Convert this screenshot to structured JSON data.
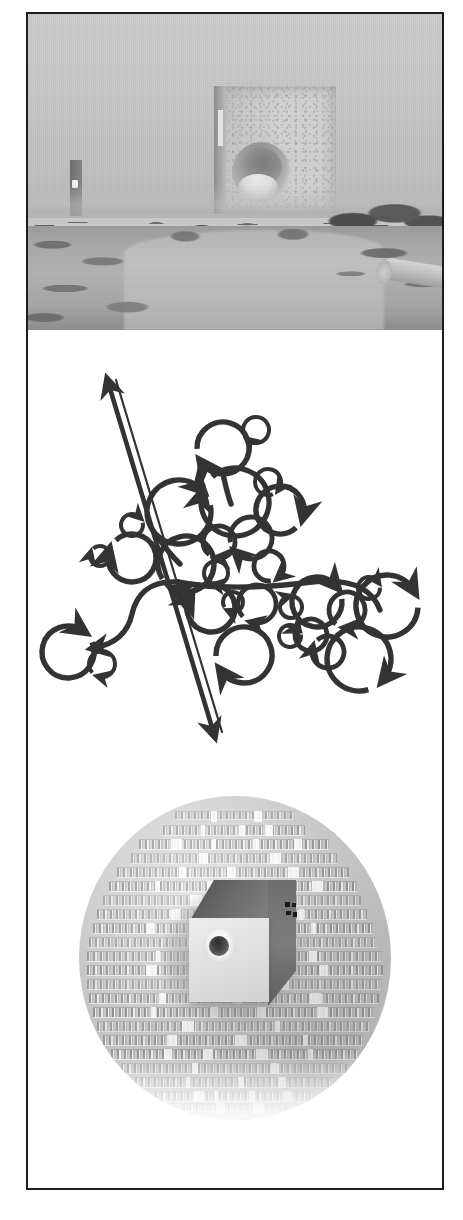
{
  "figure": {
    "panel_count": 3,
    "frame_color": "#1d1d1d",
    "background_color": "#ffffff"
  },
  "panels": [
    {
      "id": "photo",
      "type": "photograph",
      "palette": "grayscale",
      "description": "Overcast outdoor landscape with a dirt path, low scrub vegetation, a large cubic concrete monolith with a circular aperture on the horizon, a thin tall monolith at left, and a pale pipe lying at lower right.",
      "elements": [
        {
          "name": "sky",
          "label": "Overcast sky",
          "color": "#cbcbcb"
        },
        {
          "name": "monolith-large",
          "label": "Large cubic monolith with circular aperture",
          "color": "#c9c9c9"
        },
        {
          "name": "monolith-small",
          "label": "Tall narrow monolith",
          "color": "#7e7e7e"
        },
        {
          "name": "treeline",
          "label": "Distant scrub treeline",
          "color": "#5f5f5f"
        },
        {
          "name": "path",
          "label": "Dirt path",
          "color": "#bababa"
        },
        {
          "name": "pipe",
          "label": "Pipe in foreground",
          "color": "#c4c4c4"
        }
      ]
    },
    {
      "id": "diagram",
      "type": "line-diagram",
      "palette": "black on white",
      "stroke_color": "#333333",
      "description": "Abstract schematic of branching curved paths studded with circular arrow loops of varying radii, crossed by a long double-headed straight arrow running from upper-left to lower-right.",
      "elements": [
        {
          "name": "double-headed-axis-arrow",
          "label": "Double-headed straight arrow"
        },
        {
          "name": "branch-curve-left",
          "label": "Left branching curve"
        },
        {
          "name": "branch-curve-right",
          "label": "Right branching curve"
        },
        {
          "name": "circular-arrow-loops",
          "label": "Circular arrow loops",
          "count": 29
        }
      ]
    },
    {
      "id": "disc",
      "type": "rendered-object",
      "palette": "grayscale",
      "description": "A circular disc surfaced with rows of extruded three-dimensional lettering, with a light cube bearing a circular bore set into its centre and four small dark square markers at upper right.",
      "elements": [
        {
          "name": "textured-disc",
          "label": "Disc of extruded text rows",
          "color": "#c9c9c9"
        },
        {
          "name": "embedded-cube",
          "label": "Cube with circular bore",
          "color": "#e2e2e2"
        },
        {
          "name": "cube-bore",
          "label": "Circular bore",
          "color": "#3a3a3a"
        },
        {
          "name": "registration-marks",
          "label": "Dark square registration marks",
          "count": 4,
          "color": "#1b1b1b"
        }
      ]
    }
  ],
  "diagram_geometry": {
    "axis_arrow": {
      "x1": 80,
      "y1": 48,
      "x2": 188,
      "y2": 408
    },
    "loops": [
      {
        "cx": 228,
        "cy": 100,
        "r": 13,
        "head": 135
      },
      {
        "cx": 195,
        "cy": 118,
        "r": 26,
        "head": 150
      },
      {
        "cx": 207,
        "cy": 172,
        "r": 34,
        "head": 200
      },
      {
        "cx": 240,
        "cy": 152,
        "r": 13,
        "head": 40
      },
      {
        "cx": 252,
        "cy": 180,
        "r": 24,
        "head": 20
      },
      {
        "cx": 151,
        "cy": 182,
        "r": 32,
        "head": 320
      },
      {
        "cx": 191,
        "cy": 212,
        "r": 16,
        "head": 100
      },
      {
        "cx": 223,
        "cy": 208,
        "r": 21,
        "head": 140
      },
      {
        "cx": 241,
        "cy": 236,
        "r": 15,
        "head": 55
      },
      {
        "cx": 104,
        "cy": 195,
        "r": 11,
        "head": 320
      },
      {
        "cx": 104,
        "cy": 228,
        "r": 24,
        "head": 200
      },
      {
        "cx": 72,
        "cy": 226,
        "r": 10,
        "head": 200
      },
      {
        "cx": 158,
        "cy": 234,
        "r": 28,
        "head": 120
      },
      {
        "cx": 188,
        "cy": 243,
        "r": 12,
        "head": 105
      },
      {
        "cx": 183,
        "cy": 278,
        "r": 24,
        "head": 215
      },
      {
        "cx": 205,
        "cy": 272,
        "r": 10,
        "head": 120
      },
      {
        "cx": 229,
        "cy": 274,
        "r": 19,
        "head": 110
      },
      {
        "cx": 40,
        "cy": 322,
        "r": 26,
        "head": 310
      },
      {
        "cx": 74,
        "cy": 334,
        "r": 13,
        "head": 110
      },
      {
        "cx": 263,
        "cy": 277,
        "r": 11,
        "head": 260
      },
      {
        "cx": 289,
        "cy": 272,
        "r": 25,
        "head": 325
      },
      {
        "cx": 283,
        "cy": 305,
        "r": 16,
        "head": 215
      },
      {
        "cx": 319,
        "cy": 280,
        "r": 18,
        "head": 100
      },
      {
        "cx": 341,
        "cy": 258,
        "r": 11,
        "head": 330
      },
      {
        "cx": 359,
        "cy": 276,
        "r": 31,
        "head": 335
      },
      {
        "cx": 300,
        "cy": 322,
        "r": 16,
        "head": 200
      },
      {
        "cx": 216,
        "cy": 325,
        "r": 28,
        "head": 150
      },
      {
        "cx": 262,
        "cy": 306,
        "r": 11,
        "head": 325
      },
      {
        "cx": 331,
        "cy": 329,
        "r": 32,
        "head": 45
      }
    ],
    "disc_text_rows": [
      {
        "top": 16,
        "left": 96,
        "width": 118
      },
      {
        "top": 30,
        "left": 84,
        "width": 142
      },
      {
        "top": 44,
        "left": 60,
        "width": 190
      },
      {
        "top": 58,
        "left": 52,
        "width": 206
      },
      {
        "top": 72,
        "left": 38,
        "width": 232
      },
      {
        "top": 86,
        "left": 30,
        "width": 248
      },
      {
        "top": 100,
        "left": 24,
        "width": 258
      },
      {
        "top": 114,
        "left": 18,
        "width": 270
      },
      {
        "top": 128,
        "left": 14,
        "width": 280
      },
      {
        "top": 142,
        "left": 10,
        "width": 288
      },
      {
        "top": 156,
        "left": 8,
        "width": 294
      },
      {
        "top": 170,
        "left": 8,
        "width": 296
      },
      {
        "top": 184,
        "left": 8,
        "width": 294
      },
      {
        "top": 198,
        "left": 10,
        "width": 290
      },
      {
        "top": 212,
        "left": 14,
        "width": 282
      },
      {
        "top": 226,
        "left": 18,
        "width": 272
      },
      {
        "top": 240,
        "left": 24,
        "width": 260
      },
      {
        "top": 254,
        "left": 32,
        "width": 246
      },
      {
        "top": 268,
        "left": 42,
        "width": 226
      },
      {
        "top": 282,
        "left": 56,
        "width": 198
      },
      {
        "top": 296,
        "left": 76,
        "width": 158
      },
      {
        "top": 308,
        "left": 104,
        "width": 104
      }
    ]
  }
}
